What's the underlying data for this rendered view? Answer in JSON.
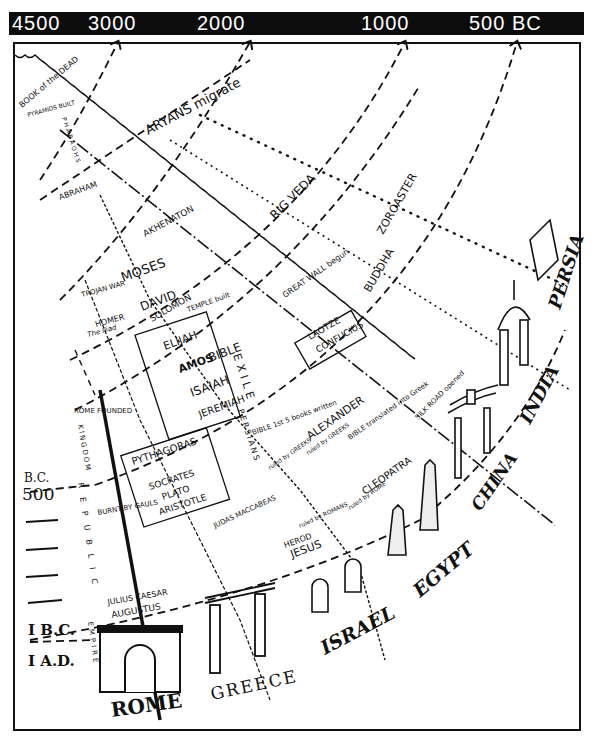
{
  "timebar": {
    "ticks": [
      {
        "label": "4500",
        "x": 12
      },
      {
        "label": "3000",
        "x": 88
      },
      {
        "label": "2000",
        "x": 196
      },
      {
        "label": "1000",
        "x": 360
      },
      {
        "label": "500 BC",
        "x": 468
      }
    ]
  },
  "side_scale": {
    "bc_label": "B.C.",
    "bc500_label": "500",
    "one_bc": "I B.C.",
    "one_ad": "I A.D."
  },
  "eras_rome": {
    "kingdom": "KINGDOM",
    "republic": "REPUBLIC",
    "empire": "EMPIRE"
  },
  "events": {
    "book_of_dead": "BOOK of the DEAD",
    "pyramids": "PYRAMIDS BUILT",
    "pharaohs": "PHARAOHS",
    "aryans": "ARYANS migrate",
    "abraham": "ABRAHAM",
    "akhenaton": "AKHENATON",
    "rig_veda": "RIG VEDA",
    "zoroaster": "ZOROASTER",
    "moses": "MOSES",
    "trojan_war": "TROJAN WAR",
    "homer": "HOMER",
    "iliad": "The Iliad",
    "david": "DAVID",
    "solomon": "SOLOMON",
    "temple": "TEMPLE built",
    "great_wall": "GREAT WALL begun",
    "buddha": "BUDDHA",
    "laotze": "LAOTZE",
    "confucius": "CONFUCIUS",
    "elijah": "ELIJAH",
    "amos": "AMOS",
    "bible": "BIBLE",
    "isaiah": "ISAIAH",
    "jeremiah": "JEREMIAH",
    "exile": "EXILE",
    "persians": "PERSIANS",
    "bible5": "BIBLE 1st 5 books written",
    "alexander": "ALEXANDER",
    "bible_greek": "BIBLE translated into Greek",
    "silk_road": "SILK ROAD opened",
    "rome_founded": "ROME FOUNDED",
    "pythagoras": "PYTHAGORAS",
    "socrates": "SOCRATES",
    "plato": "PLATO",
    "aristotle": "ARISTOTLE",
    "burnt_by_gauls": "BURNT BY GAULS",
    "ruled_by_greeks_1": "ruled by GREEKS",
    "ruled_by_greeks_2": "ruled by GREEKS",
    "judas": "JUDAS MACCABEAS",
    "cleopatra": "CLEOPATRA",
    "ruled_by_rome": "ruled by ROME",
    "ruled_by_romans": "ruled by ROMANS",
    "herod": "HEROD",
    "jesus": "JESUS",
    "julius": "JULIUS CAESAR",
    "augustus": "AUGUSTUS"
  },
  "civilizations": {
    "rome": "ROME",
    "greece": "GREECE",
    "israel": "ISRAEL",
    "egypt": "EGYPT",
    "china": "CHINA",
    "india": "INDIA",
    "persia": "PERSIA"
  }
}
